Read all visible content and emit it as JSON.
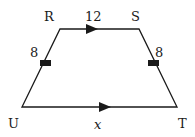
{
  "diagram": {
    "type": "trapezoid",
    "vertices": {
      "R": {
        "label": "R"
      },
      "S": {
        "label": "S"
      },
      "T": {
        "label": "T"
      },
      "U": {
        "label": "U"
      }
    },
    "sides": {
      "RS": {
        "label": "12",
        "parallel_marker": true
      },
      "UT": {
        "label": "x",
        "parallel_marker": true
      },
      "RU": {
        "label": "8",
        "congruent_tick": true
      },
      "ST": {
        "label": "8",
        "congruent_tick": true
      }
    },
    "colors": {
      "stroke": "#1a1a1a",
      "background": "#ffffff"
    }
  }
}
